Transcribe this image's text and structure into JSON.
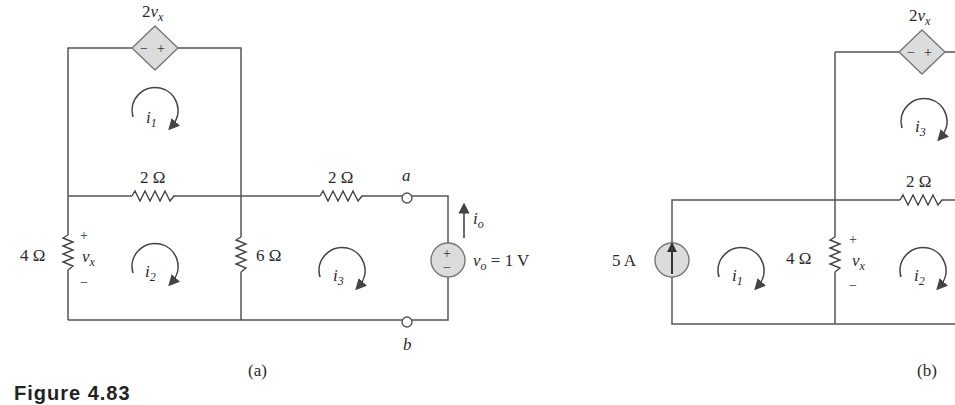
{
  "figure": {
    "caption": "Figure 4.83"
  },
  "circuit_a": {
    "label": "(a)",
    "dependent_source": {
      "label_coef": "2",
      "label_var": "v",
      "label_sub": "x",
      "polarity_left": "−",
      "polarity_right": "+"
    },
    "resistors": {
      "top_middle": "2 Ω",
      "right_middle": "2 Ω",
      "left": "4 Ω",
      "center": "6 Ω"
    },
    "vx_label": {
      "var": "v",
      "sub": "x",
      "plus": "+",
      "minus": "−"
    },
    "mesh_currents": [
      {
        "var": "i",
        "sub": "1"
      },
      {
        "var": "i",
        "sub": "2"
      },
      {
        "var": "i",
        "sub": "3"
      }
    ],
    "terminals": {
      "a": "a",
      "b": "b"
    },
    "output_current": {
      "var": "i",
      "sub": "o"
    },
    "voltage_source": {
      "var": "v",
      "sub": "o",
      "value": " = 1 V",
      "plus": "+",
      "minus": "−"
    }
  },
  "circuit_b": {
    "label": "(b)",
    "dependent_source": {
      "label_coef": "2",
      "label_var": "v",
      "label_sub": "x",
      "polarity_left": "−",
      "polarity_right": "+"
    },
    "current_source": "5 A",
    "resistors": {
      "top": "2 Ω",
      "left": "4 Ω"
    },
    "vx_label": {
      "var": "v",
      "sub": "x",
      "plus": "+",
      "minus": "−"
    },
    "mesh_currents": [
      {
        "var": "i",
        "sub": "1"
      },
      {
        "var": "i",
        "sub": "2"
      },
      {
        "var": "i",
        "sub": "3"
      }
    ]
  }
}
